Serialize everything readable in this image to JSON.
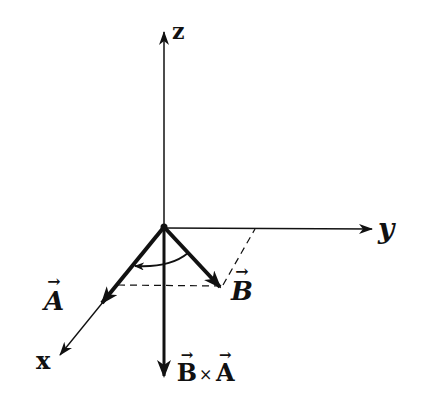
{
  "diagram": {
    "type": "3d-cross-product-diagram",
    "axes": {
      "z": {
        "label": "z"
      },
      "y": {
        "label": "y"
      },
      "x": {
        "label": "x"
      }
    },
    "vectors": {
      "a": {
        "label": "A",
        "arrow": "→"
      },
      "b": {
        "label": "B",
        "arrow": "→"
      },
      "cross": {
        "left": "B",
        "op": "×",
        "right": "A",
        "arrow": "→"
      }
    },
    "colors": {
      "ink": "#111111",
      "background": "#ffffff"
    }
  }
}
